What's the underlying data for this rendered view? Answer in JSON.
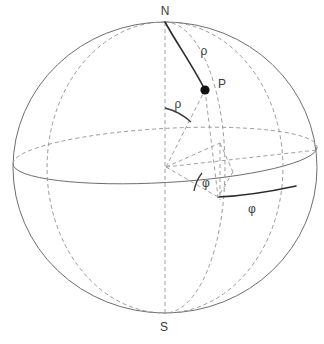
{
  "figure": {
    "type": "geometry-diagram",
    "background_color": "#ffffff",
    "stroke_color": "#6e6e6e",
    "hidden_stroke_color": "#9a9a9a",
    "accent_color": "#2b2b2b"
  },
  "labels": {
    "north_pole": "N",
    "south_pole": "S",
    "point": "P",
    "rho_arc": "ρ",
    "rho_angle": "ρ",
    "phi_angle": "φ",
    "phi_arc": "φ"
  },
  "geometry": {
    "sphere": {
      "center_x": 165,
      "center_y": 167.5,
      "radius_x": 152,
      "radius_y": 145.5
    },
    "equator": {
      "center_x": 165,
      "center_y": 171,
      "radius_x": 152,
      "radius_y": 27,
      "tilt_deg": -3.2
    },
    "meridian_through_p": {
      "center_x": 165,
      "center_y": 167.5,
      "radius_x": 60,
      "radius_y": 145.5
    },
    "back_meridian": {
      "center_x": 165,
      "center_y": 167.5,
      "radius_x": 118,
      "radius_y": 145.5
    },
    "north_pole_point": {
      "x": 165,
      "y": 22
    },
    "south_pole_point": {
      "x": 165,
      "y": 313
    },
    "center_point": {
      "x": 166,
      "y": 167
    },
    "p_point": {
      "x": 205,
      "y": 90
    },
    "p_dot_radius": 4.6,
    "p_projection_equator": {
      "x": 218,
      "y": 197
    },
    "phi_arc_end": {
      "x": 296,
      "y": 186
    }
  },
  "label_positions": {
    "north_pole": {
      "x": 165,
      "y": 15
    },
    "south_pole": {
      "x": 164,
      "y": 331
    },
    "point": {
      "x": 218,
      "y": 88
    },
    "rho_arc": {
      "x": 204,
      "y": 55
    },
    "rho_angle": {
      "x": 178,
      "y": 108
    },
    "phi_angle": {
      "x": 206,
      "y": 187
    },
    "phi_arc": {
      "x": 252,
      "y": 213
    }
  }
}
